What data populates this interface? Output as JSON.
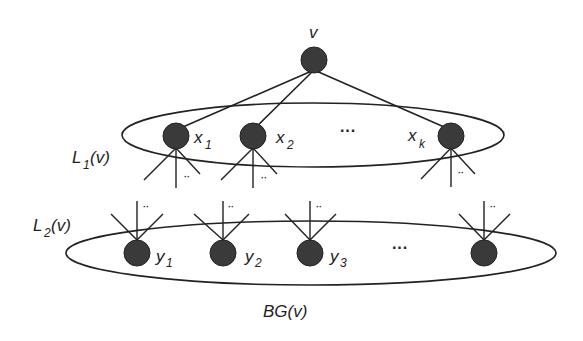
{
  "diagram": {
    "type": "layered-graph",
    "root": {
      "label": "v"
    },
    "layer1": {
      "label": "L",
      "label_sub": "1",
      "label_arg": "(v)",
      "nodes": [
        {
          "label": "x",
          "sub": "1"
        },
        {
          "label": "x",
          "sub": "2"
        },
        {
          "label": "x",
          "sub": "k"
        }
      ],
      "ellipsis": "···"
    },
    "layer2": {
      "label": "L",
      "label_sub": "2",
      "label_arg": "(v)",
      "nodes": [
        {
          "label": "y",
          "sub": "1"
        },
        {
          "label": "y",
          "sub": "2"
        },
        {
          "label": "y",
          "sub": "3"
        },
        {
          "label": "",
          "sub": ""
        }
      ],
      "ellipsis": "···"
    },
    "caption": "BG(v)",
    "edge_ellipsis": "··",
    "colors": {
      "node": "#3a3a3a",
      "stroke": "#222222",
      "background": "#ffffff"
    }
  }
}
